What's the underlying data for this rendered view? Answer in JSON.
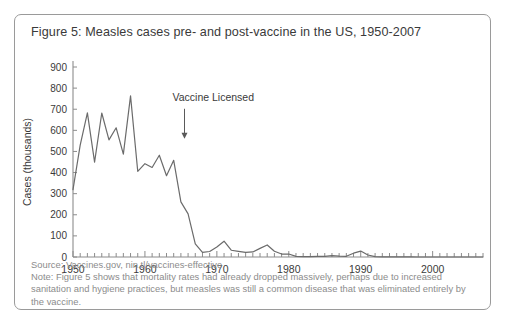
{
  "figure": {
    "title": "Figure 5: Measles cases pre- and post-vaccine in the US, 1950-2007",
    "source": "Source: Vaccines.gov, nin.tl/vaccines-effective",
    "note": "Note: Figure 5 shows that mortality rates had already dropped massively, perhaps due to increased sanitation and hygiene practices, but measles was still a common disease that was eliminated entirely by the vaccine.",
    "border_color": "#9a9a9a",
    "title_color": "#3a3a3a",
    "caption_color": "#8c8c8c"
  },
  "chart_data": {
    "type": "line",
    "title": "Figure 5: Measles cases pre- and post-vaccine in the US, 1950-2007",
    "xlabel": "",
    "ylabel": "Cases (thousands)",
    "xlim": [
      1950,
      2007
    ],
    "ylim": [
      0,
      900
    ],
    "yticks": [
      0,
      100,
      200,
      300,
      400,
      500,
      600,
      700,
      800,
      900
    ],
    "ytick_labels": [
      "0",
      "100",
      "200",
      "300",
      "400",
      "500",
      "600",
      "700",
      "800",
      "900"
    ],
    "xticks": [
      1950,
      1960,
      1970,
      1980,
      1990,
      2000
    ],
    "xtick_labels": [
      "1950",
      "1960",
      "1970",
      "1980",
      "1990",
      "2000"
    ],
    "minor_xtick_interval": 1,
    "grid": false,
    "legend": null,
    "line_color": "#6b6b6b",
    "axis_color": "#8c8c8c",
    "series": [
      {
        "name": "Measles cases (thousands)",
        "x": [
          1950,
          1951,
          1952,
          1953,
          1954,
          1955,
          1956,
          1957,
          1958,
          1959,
          1960,
          1961,
          1962,
          1963,
          1964,
          1965,
          1966,
          1967,
          1968,
          1969,
          1970,
          1971,
          1972,
          1973,
          1974,
          1975,
          1976,
          1977,
          1978,
          1979,
          1980,
          1981,
          1982,
          1983,
          1984,
          1985,
          1986,
          1987,
          1988,
          1989,
          1990,
          1991,
          1992,
          1993,
          1994,
          1995,
          1996,
          1997,
          1998,
          1999,
          2000,
          2001,
          2002,
          2003,
          2004,
          2005,
          2006,
          2007
        ],
        "values": [
          319,
          530,
          683,
          449,
          682,
          555,
          612,
          487,
          763,
          406,
          442,
          424,
          482,
          385,
          458,
          261,
          204,
          62,
          22,
          26,
          47,
          75,
          32,
          27,
          22,
          24,
          41,
          57,
          27,
          14,
          14,
          3,
          2,
          1.5,
          2.6,
          2.8,
          6.3,
          3.7,
          3.4,
          18,
          28,
          9.6,
          2.2,
          0.3,
          0.96,
          0.3,
          0.5,
          0.14,
          0.1,
          0.1,
          0.086,
          0.116,
          0.044,
          0.056,
          0.037,
          0.066,
          0.055,
          0.043
        ]
      }
    ],
    "annotations": [
      {
        "text": "Vaccine Licensed",
        "x": 1963,
        "arrow_to_x": 1963,
        "arrow_to_y": 560,
        "label_y": 740
      }
    ]
  }
}
